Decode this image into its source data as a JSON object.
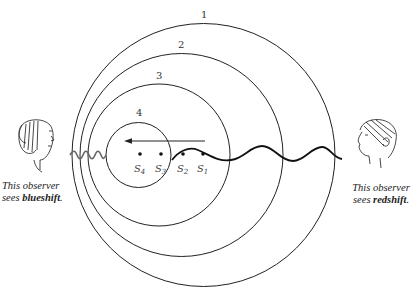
{
  "figure": {
    "wavefront_labels": [
      "1",
      "2",
      "3",
      "4"
    ],
    "source_labels": [
      "S1",
      "S2",
      "S3",
      "S4"
    ],
    "colors": {
      "lines": "#222222",
      "short_wave": "#666666"
    },
    "left_observer": {
      "line1": "This observer",
      "line2_prefix": "sees ",
      "line2_bold": "blueshift",
      "line2_suffix": "."
    },
    "right_observer": {
      "line1": "This observer",
      "line2_prefix": "sees ",
      "line2_bold": "redshift",
      "line2_suffix": "."
    }
  }
}
